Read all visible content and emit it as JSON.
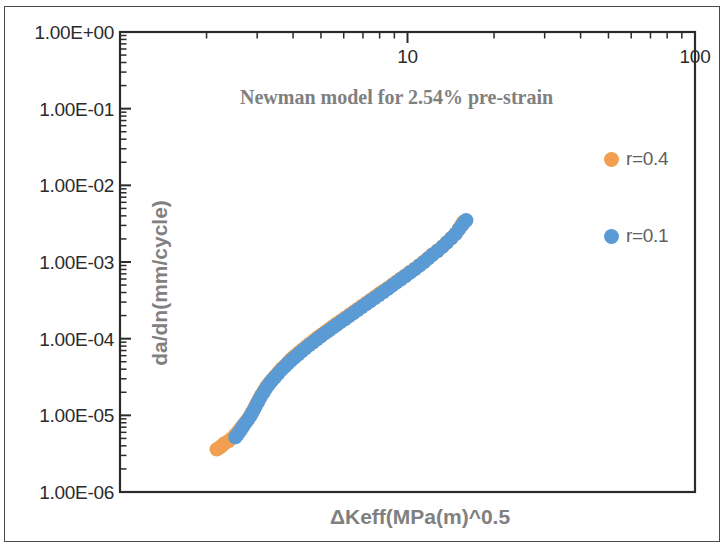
{
  "chart_data": {
    "type": "scatter",
    "title": "Newman model for 2.54% pre-strain",
    "xlabel": "ΔKeff(MPa(m)^0.5",
    "ylabel": "da/dn(mm/cycle)",
    "xscale": "log",
    "yscale": "log",
    "xlim": [
      1,
      100
    ],
    "ylim": [
      1e-06,
      1
    ],
    "x_axis_position": "top",
    "grid": false,
    "legend_position": "right-inside",
    "x_tick_labels": [
      "10",
      "100"
    ],
    "x_tick_values": [
      10,
      100
    ],
    "y_tick_labels": [
      "1.00E+00",
      "1.00E-01",
      "1.00E-02",
      "1.00E-03",
      "1.00E-04",
      "1.00E-05",
      "1.00E-06"
    ],
    "y_tick_values": [
      1,
      0.1,
      0.01,
      0.001,
      0.0001,
      1e-05,
      1e-06
    ],
    "colors": {
      "series_r04": "#F0A050",
      "series_r01": "#5B9BD5",
      "axis": "#2b2b2b",
      "title_text": "#808080",
      "axis_title_text": "#808080",
      "legend_text": "#5f5f5f",
      "background": "#ffffff"
    },
    "series": [
      {
        "name": "r=0.4",
        "color": "#F0A050",
        "marker": "circle",
        "points": [
          [
            2.17,
            3.6e-06
          ],
          [
            2.22,
            3.8e-06
          ],
          [
            2.26,
            4e-06
          ],
          [
            2.31,
            4.3e-06
          ],
          [
            2.38,
            4.6e-06
          ],
          [
            2.45,
            5e-06
          ],
          [
            2.52,
            5.6e-06
          ],
          [
            2.58,
            6.2e-06
          ],
          [
            2.63,
            6.8e-06
          ],
          [
            2.68,
            7.4e-06
          ],
          [
            2.74,
            8.2e-06
          ],
          [
            2.8,
            9.2e-06
          ],
          [
            2.86,
            1.05e-05
          ],
          [
            2.92,
            1.2e-05
          ],
          [
            2.98,
            1.4e-05
          ],
          [
            3.04,
            1.6e-05
          ],
          [
            3.1,
            1.85e-05
          ],
          [
            3.17,
            2.1e-05
          ],
          [
            3.24,
            2.4e-05
          ],
          [
            3.32,
            2.7e-05
          ],
          [
            3.4,
            3e-05
          ],
          [
            3.48,
            3.3e-05
          ],
          [
            3.57,
            3.7e-05
          ],
          [
            3.66,
            4.1e-05
          ],
          [
            3.76,
            4.5e-05
          ],
          [
            3.86,
            5e-05
          ],
          [
            3.96,
            5.5e-05
          ],
          [
            4.07,
            6e-05
          ],
          [
            4.19,
            6.6e-05
          ],
          [
            4.31,
            7.2e-05
          ],
          [
            4.44,
            7.9e-05
          ],
          [
            4.57,
            8.6e-05
          ],
          [
            4.71,
            9.4e-05
          ],
          [
            4.86,
            0.000103
          ],
          [
            5.01,
            0.000112
          ],
          [
            5.17,
            0.000122
          ],
          [
            5.34,
            0.000133
          ],
          [
            5.51,
            0.000145
          ],
          [
            5.69,
            0.000158
          ],
          [
            5.88,
            0.000172
          ],
          [
            6.08,
            0.000188
          ],
          [
            6.28,
            0.000205
          ],
          [
            6.5,
            0.000224
          ],
          [
            6.72,
            0.000245
          ],
          [
            6.95,
            0.000268
          ],
          [
            7.19,
            0.000293
          ],
          [
            7.44,
            0.00032
          ],
          [
            7.7,
            0.00035
          ],
          [
            7.97,
            0.000385
          ],
          [
            8.25,
            0.00042
          ],
          [
            8.55,
            0.00046
          ],
          [
            8.85,
            0.000505
          ],
          [
            9.17,
            0.000555
          ],
          [
            9.5,
            0.00061
          ],
          [
            9.84,
            0.00067
          ],
          [
            10.2,
            0.00074
          ],
          [
            10.6,
            0.00082
          ],
          [
            11.0,
            0.00091
          ],
          [
            11.4,
            0.00101
          ],
          [
            11.8,
            0.00112
          ],
          [
            12.2,
            0.00125
          ],
          [
            12.7,
            0.0014
          ],
          [
            13.2,
            0.00158
          ],
          [
            13.7,
            0.0018
          ],
          [
            14.2,
            0.00205
          ],
          [
            14.7,
            0.00235
          ],
          [
            15.1,
            0.0027
          ],
          [
            15.4,
            0.003
          ],
          [
            15.6,
            0.0033
          ]
        ]
      },
      {
        "name": "r=0.1",
        "color": "#5B9BD5",
        "marker": "circle",
        "points": [
          [
            2.52,
            5.2e-06
          ],
          [
            2.57,
            5.7e-06
          ],
          [
            2.62,
            6.3e-06
          ],
          [
            2.67,
            7e-06
          ],
          [
            2.72,
            7.8e-06
          ],
          [
            2.78,
            8.7e-06
          ],
          [
            2.84,
            9.8e-06
          ],
          [
            2.9,
            1.12e-05
          ],
          [
            2.96,
            1.3e-05
          ],
          [
            3.02,
            1.5e-05
          ],
          [
            3.08,
            1.72e-05
          ],
          [
            3.15,
            1.97e-05
          ],
          [
            3.22,
            2.25e-05
          ],
          [
            3.3,
            2.55e-05
          ],
          [
            3.38,
            2.85e-05
          ],
          [
            3.46,
            3.15e-05
          ],
          [
            3.55,
            3.5e-05
          ],
          [
            3.64,
            3.9e-05
          ],
          [
            3.74,
            4.3e-05
          ],
          [
            3.84,
            4.75e-05
          ],
          [
            3.94,
            5.2e-05
          ],
          [
            4.05,
            5.7e-05
          ],
          [
            4.17,
            6.25e-05
          ],
          [
            4.29,
            6.85e-05
          ],
          [
            4.42,
            7.5e-05
          ],
          [
            4.55,
            8.2e-05
          ],
          [
            4.69,
            8.95e-05
          ],
          [
            4.84,
            9.8e-05
          ],
          [
            4.99,
            0.000107
          ],
          [
            5.15,
            0.000117
          ],
          [
            5.32,
            0.000127
          ],
          [
            5.49,
            0.000139
          ],
          [
            5.67,
            0.000151
          ],
          [
            5.86,
            0.000165
          ],
          [
            6.06,
            0.00018
          ],
          [
            6.26,
            0.000197
          ],
          [
            6.48,
            0.000215
          ],
          [
            6.7,
            0.000235
          ],
          [
            6.93,
            0.000257
          ],
          [
            7.17,
            0.000281
          ],
          [
            7.42,
            0.000308
          ],
          [
            7.68,
            0.000337
          ],
          [
            7.95,
            0.00037
          ],
          [
            8.23,
            0.000405
          ],
          [
            8.53,
            0.000445
          ],
          [
            8.83,
            0.00049
          ],
          [
            9.15,
            0.00054
          ],
          [
            9.48,
            0.000595
          ],
          [
            9.82,
            0.000655
          ],
          [
            10.2,
            0.000725
          ],
          [
            10.6,
            0.000805
          ],
          [
            11.0,
            0.000895
          ],
          [
            11.4,
            0.000995
          ],
          [
            11.8,
            0.00111
          ],
          [
            12.2,
            0.00124
          ],
          [
            12.7,
            0.00139
          ],
          [
            13.2,
            0.00157
          ],
          [
            13.7,
            0.00179
          ],
          [
            14.2,
            0.00204
          ],
          [
            14.7,
            0.00233
          ],
          [
            15.1,
            0.00268
          ],
          [
            15.5,
            0.00305
          ],
          [
            15.8,
            0.00335
          ],
          [
            16.0,
            0.0035
          ]
        ]
      }
    ]
  },
  "legend": {
    "entries": [
      {
        "label": "r=0.4",
        "color": "#F0A050"
      },
      {
        "label": "r=0.1",
        "color": "#5B9BD5"
      }
    ]
  }
}
